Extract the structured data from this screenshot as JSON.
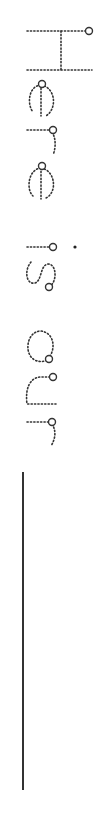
{
  "worksheet": {
    "trace_text": "Here is our",
    "orientation": "rotated 90deg clockwise (reads top-to-bottom)",
    "letters": [
      "H",
      "e",
      "r",
      "e",
      "i",
      "s",
      "o",
      "u",
      "r"
    ],
    "stroke_color": "#333333",
    "background_color": "#ffffff",
    "writing_line": {
      "present": true
    }
  }
}
